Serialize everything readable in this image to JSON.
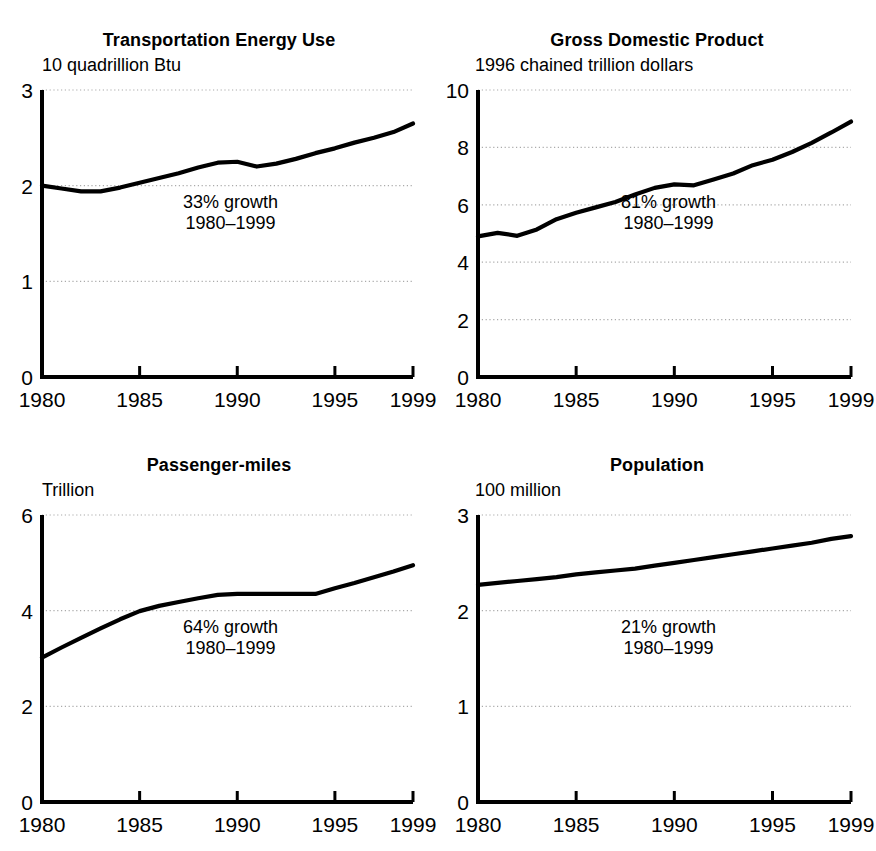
{
  "figure": {
    "cut_off_title_fragment": "",
    "x_axis_ticks": [
      "1980",
      "1985",
      "1990",
      "1995",
      "1999"
    ],
    "x_axis_tick_years": [
      1980,
      1985,
      1990,
      1995,
      1999
    ],
    "line_color": "#000000",
    "grid_color": "#aaaaaa",
    "axis_color": "#000000"
  },
  "chart_data": [
    {
      "type": "line",
      "title": "Transportation Energy Use",
      "ylabel": "10 quadrillion Btu",
      "xlabel": "",
      "ylim": [
        0,
        3
      ],
      "yticks": [
        0,
        1,
        2,
        3
      ],
      "ytick_labels": [
        "0",
        "1",
        "2",
        "3"
      ],
      "xlim": [
        1980,
        1999
      ],
      "xticks": [
        1980,
        1985,
        1990,
        1995,
        1999
      ],
      "xtick_labels": [
        "1980",
        "1985",
        "1990",
        "1995",
        "1999"
      ],
      "grid": "horizontal-dotted",
      "annotation": [
        "33% growth",
        "1980–1999"
      ],
      "legend": "none",
      "x": [
        1980,
        1981,
        1982,
        1983,
        1984,
        1985,
        1986,
        1987,
        1988,
        1989,
        1990,
        1991,
        1992,
        1993,
        1994,
        1995,
        1996,
        1997,
        1998,
        1999
      ],
      "values": [
        2.0,
        1.97,
        1.94,
        1.94,
        1.98,
        2.03,
        2.08,
        2.13,
        2.19,
        2.24,
        2.25,
        2.2,
        2.23,
        2.28,
        2.34,
        2.39,
        2.45,
        2.5,
        2.56,
        2.65
      ]
    },
    {
      "type": "line",
      "title": "Gross Domestic Product",
      "ylabel": "1996 chained trillion dollars",
      "xlabel": "",
      "ylim": [
        0,
        10
      ],
      "yticks": [
        0,
        2,
        4,
        6,
        8,
        10
      ],
      "ytick_labels": [
        "0",
        "2",
        "4",
        "6",
        "8",
        "10"
      ],
      "xlim": [
        1980,
        1999
      ],
      "xticks": [
        1980,
        1985,
        1990,
        1995,
        1999
      ],
      "xtick_labels": [
        "1980",
        "1985",
        "1990",
        "1995",
        "1999"
      ],
      "grid": "horizontal-dotted",
      "annotation": [
        "81% growth",
        "1980–1999"
      ],
      "legend": "none",
      "x": [
        1980,
        1981,
        1982,
        1983,
        1984,
        1985,
        1986,
        1987,
        1988,
        1989,
        1990,
        1991,
        1992,
        1993,
        1994,
        1995,
        1996,
        1997,
        1998,
        1999
      ],
      "values": [
        4.9,
        5.02,
        4.92,
        5.14,
        5.5,
        5.72,
        5.91,
        6.1,
        6.36,
        6.59,
        6.71,
        6.68,
        6.88,
        7.09,
        7.38,
        7.57,
        7.84,
        8.16,
        8.52,
        8.9
      ]
    },
    {
      "type": "line",
      "title": "Passenger-miles",
      "ylabel": "Trillion",
      "xlabel": "",
      "ylim": [
        0,
        6
      ],
      "yticks": [
        0,
        2,
        4,
        6
      ],
      "ytick_labels": [
        "0",
        "2",
        "4",
        "6"
      ],
      "xlim": [
        1980,
        1999
      ],
      "xticks": [
        1980,
        1985,
        1990,
        1995,
        1999
      ],
      "xtick_labels": [
        "1980",
        "1985",
        "1990",
        "1995",
        "1999"
      ],
      "grid": "horizontal-dotted",
      "annotation": [
        "64% growth",
        "1980–1999"
      ],
      "legend": "none",
      "x": [
        1980,
        1981,
        1982,
        1983,
        1984,
        1985,
        1986,
        1987,
        1988,
        1989,
        1990,
        1991,
        1992,
        1993,
        1994,
        1995,
        1996,
        1997,
        1998,
        1999
      ],
      "values": [
        3.02,
        3.23,
        3.43,
        3.63,
        3.82,
        3.99,
        4.1,
        4.18,
        4.26,
        4.33,
        4.35,
        4.35,
        4.35,
        4.35,
        4.35,
        4.47,
        4.58,
        4.7,
        4.82,
        4.95
      ]
    },
    {
      "type": "line",
      "title": "Population",
      "ylabel": "100 million",
      "xlabel": "",
      "ylim": [
        0,
        3
      ],
      "yticks": [
        0,
        1,
        2,
        3
      ],
      "ytick_labels": [
        "0",
        "1",
        "2",
        "3"
      ],
      "xlim": [
        1980,
        1999
      ],
      "xticks": [
        1980,
        1985,
        1990,
        1995,
        1999
      ],
      "xtick_labels": [
        "1980",
        "1985",
        "1990",
        "1995",
        "1999"
      ],
      "grid": "horizontal-dotted",
      "annotation": [
        "21% growth",
        "1980–1999"
      ],
      "legend": "none",
      "x": [
        1980,
        1981,
        1982,
        1983,
        1984,
        1985,
        1986,
        1987,
        1988,
        1989,
        1990,
        1991,
        1992,
        1993,
        1994,
        1995,
        1996,
        1997,
        1998,
        1999
      ],
      "values": [
        2.27,
        2.29,
        2.31,
        2.33,
        2.35,
        2.38,
        2.4,
        2.42,
        2.44,
        2.47,
        2.5,
        2.53,
        2.56,
        2.59,
        2.62,
        2.65,
        2.68,
        2.71,
        2.75,
        2.78
      ]
    }
  ]
}
